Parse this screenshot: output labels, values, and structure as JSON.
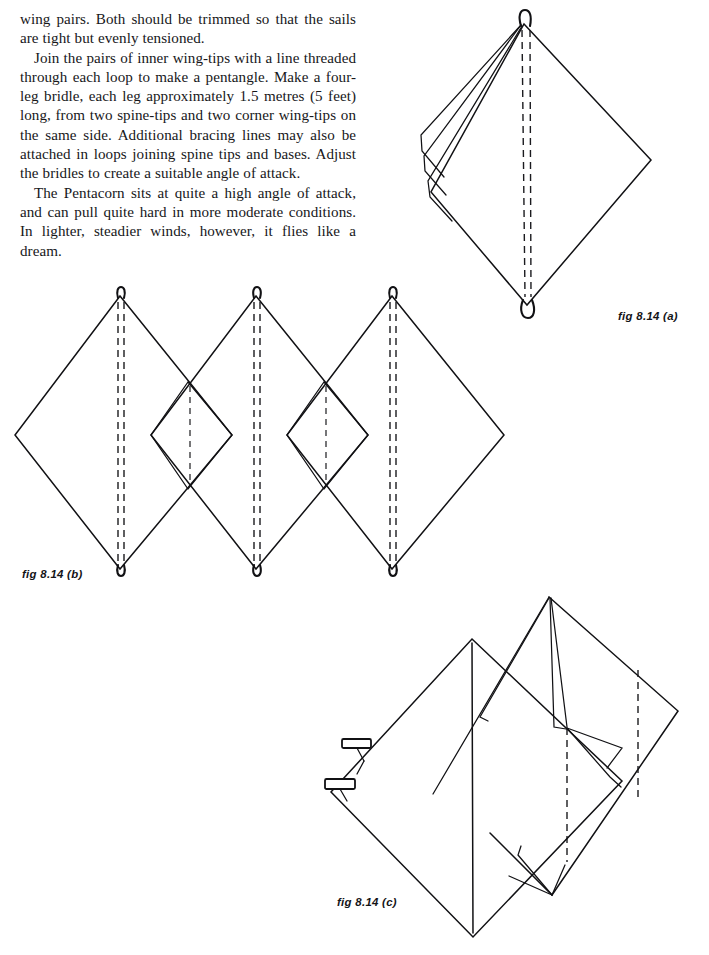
{
  "page": {
    "width": 709,
    "height": 955,
    "background_color": "#ffffff",
    "ink_color": "#111114"
  },
  "body_text": {
    "paragraphs": [
      "wing pairs. Both should be trimmed so that the sails are tight but evenly tensioned.",
      "Join the pairs of inner wing-tips with a line threaded through each loop to make a pentangle. Make a four-leg bridle, each leg approximately 1.5 metres (5 feet) long, from two spine-tips and two corner wing-tips on the same side. Additional bracing lines may also be attached in loops joining spine tips and bases. Adjust the bridles to create a suitable angle of attack.",
      "The Pentacorn sits at quite a high angle of attack, and can pull quite hard in more moderate conditions. In lighter, steadier winds, however, it flies like a dream."
    ]
  },
  "figures": {
    "a": {
      "caption": "fig 8.14 (a)",
      "description": "Single diamond kite seen at an angle, with three stacked wing folds on the left side, a double-dashed spine, and small sewn loops at the top and bottom spine tips."
    },
    "b": {
      "caption": "fig 8.14 (b)",
      "description": "Three overlapping diamond sails laid flat side by side; each large diamond has a double-dashed spine and a loop at top and bottom; small diamonds form in the two overlap regions, each with a single dashed spine."
    },
    "c": {
      "caption": "fig 8.14 (c)",
      "description": "Two diamond kites joined at an angle, one in front and one behind, with two rectangular bridle-loop tabs on the left lower edge and a dashed spine on the rear sail."
    }
  }
}
